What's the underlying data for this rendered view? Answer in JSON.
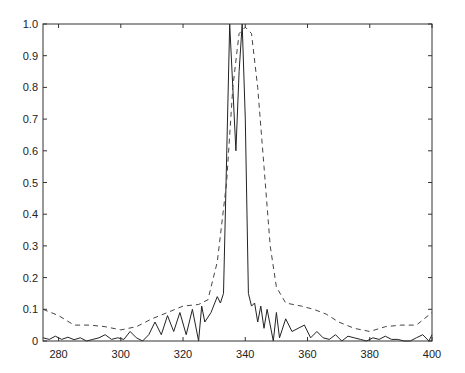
{
  "chart_data": {
    "type": "line",
    "title": "",
    "xlabel": "",
    "ylabel": "",
    "xlim": [
      275,
      400
    ],
    "ylim": [
      0,
      1.0
    ],
    "grid": false,
    "legend": null,
    "x_ticks": [
      "280",
      "300",
      "320",
      "340",
      "360",
      "380",
      "400"
    ],
    "y_ticks": [
      "0",
      "0.1",
      "0.2",
      "0.3",
      "0.4",
      "0.5",
      "0.6",
      "0.7",
      "0.8",
      "0.9",
      "1.0"
    ],
    "series": [
      {
        "name": "solid",
        "style": "solid",
        "color": "#222222",
        "x": [
          275,
          277,
          279,
          281,
          283,
          285,
          287,
          289,
          291,
          293,
          295,
          297,
          299,
          301,
          303,
          305,
          307,
          309,
          311,
          313,
          315,
          317,
          319,
          321,
          323,
          325,
          326,
          327,
          329,
          331,
          332,
          333,
          335,
          336,
          337,
          338,
          339,
          340,
          341,
          342,
          343,
          344,
          345,
          346,
          347,
          349,
          350,
          351,
          353,
          355,
          357,
          359,
          361,
          363,
          365,
          367,
          369,
          371,
          373,
          375,
          377,
          379,
          381,
          383,
          385,
          387,
          389,
          391,
          393,
          395,
          397,
          399,
          400
        ],
        "y": [
          0.01,
          0.005,
          0.015,
          0.005,
          0.012,
          0.004,
          0.01,
          0.0,
          0.005,
          0.01,
          0.02,
          0.005,
          0.01,
          0.005,
          0.03,
          0.01,
          0.0,
          0.02,
          0.06,
          0.02,
          0.08,
          0.03,
          0.09,
          0.02,
          0.1,
          0.0,
          0.11,
          0.06,
          0.09,
          0.14,
          0.12,
          0.15,
          1.0,
          0.8,
          0.6,
          0.85,
          1.0,
          0.7,
          0.15,
          0.11,
          0.12,
          0.06,
          0.11,
          0.04,
          0.1,
          0.0,
          0.09,
          0.01,
          0.07,
          0.03,
          0.04,
          0.05,
          0.01,
          0.03,
          0.01,
          0.005,
          0.02,
          0.0,
          0.015,
          0.01,
          0.005,
          0.0,
          0.01,
          0.005,
          0.015,
          0.005,
          0.005,
          0.0,
          0.0,
          0.01,
          0.02,
          0.0,
          0.02
        ]
      },
      {
        "name": "dashed",
        "style": "dashed",
        "color": "#444444",
        "x": [
          275,
          280,
          285,
          290,
          295,
          300,
          305,
          310,
          315,
          320,
          325,
          328,
          331,
          334,
          336,
          338,
          340,
          342,
          344,
          346,
          348,
          350,
          353,
          358,
          362,
          366,
          370,
          375,
          380,
          385,
          390,
          395,
          400
        ],
        "y": [
          0.1,
          0.08,
          0.05,
          0.05,
          0.045,
          0.035,
          0.045,
          0.07,
          0.09,
          0.11,
          0.115,
          0.13,
          0.25,
          0.5,
          0.8,
          0.97,
          0.99,
          0.97,
          0.8,
          0.55,
          0.3,
          0.17,
          0.12,
          0.11,
          0.1,
          0.085,
          0.06,
          0.04,
          0.03,
          0.045,
          0.05,
          0.05,
          0.09
        ]
      }
    ]
  }
}
